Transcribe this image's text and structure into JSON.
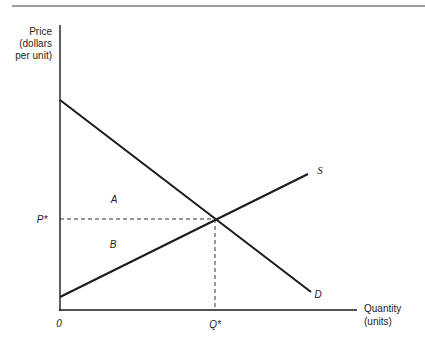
{
  "diagram": {
    "y_axis_label": [
      "Price",
      "(dollars",
      "per unit)"
    ],
    "x_axis_label": [
      "Quantity",
      "(units)"
    ],
    "origin_label": "0",
    "price_label": "P*",
    "quantity_label": "Q*",
    "supply_label": "S",
    "demand_label": "D",
    "area_a_label": "A",
    "area_b_label": "B"
  },
  "colors": {
    "line": "#1a1a1a",
    "rule": "#999999"
  }
}
